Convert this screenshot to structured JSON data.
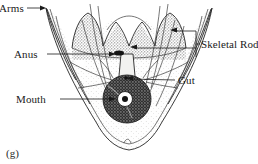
{
  "figure": {
    "caption": "(g)",
    "background_color": "#ffffff",
    "ink_color": "#1a1a1a"
  },
  "labels": {
    "arms": "Arms",
    "anus": "Anus",
    "mouth": "Mouth",
    "gut": "Gut",
    "skeletal_rods": "Skeletal Rods"
  },
  "anatomy": {
    "arms_label": "Arms",
    "anus_label": "Anus",
    "mouth_label": "Mouth",
    "gut_label": "Gut",
    "skeletal_rods_label": "Skeletal Rods"
  }
}
